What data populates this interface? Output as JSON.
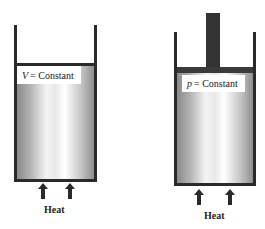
{
  "figure": {
    "left_vessel": {
      "variable": "V",
      "label_suffix": "= Constant",
      "heat_label": "Heat",
      "description": "rigid closed container, constant volume"
    },
    "right_vessel": {
      "variable": "p",
      "label_suffix": "= Constant",
      "heat_label": "Heat",
      "description": "piston-cylinder, constant pressure"
    }
  },
  "colors": {
    "wall": "#2a2a2a",
    "piston": "#3a3a3a",
    "arrow": "#2a2a2a",
    "gas_edge": "#8a8a8a",
    "gas_center": "#ffffff"
  }
}
